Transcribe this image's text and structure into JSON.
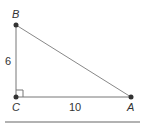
{
  "diagram": {
    "type": "right triangle",
    "vertices": {
      "B": {
        "label": "B"
      },
      "C": {
        "label": "C"
      },
      "A": {
        "label": "A"
      }
    },
    "sides": {
      "BC": {
        "length_label": "6"
      },
      "CA": {
        "length_label": "10"
      }
    },
    "right_angle_at": "C"
  }
}
